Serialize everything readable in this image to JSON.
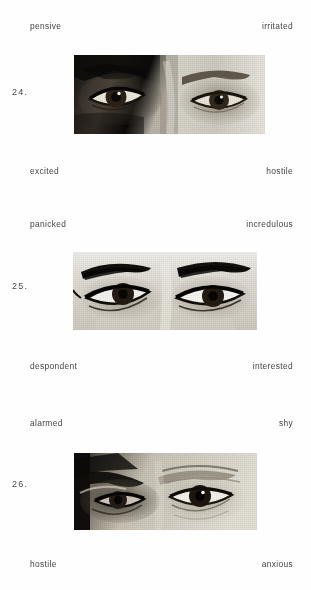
{
  "document": {
    "type": "eyes-emotion-recognition-test",
    "page_background": "#ffffff",
    "text_color": "#444444"
  },
  "items": [
    {
      "number": "24.",
      "top_left": "pensive",
      "top_right": "irritated",
      "bottom_left": "excited",
      "bottom_right": "hostile",
      "photo_alt": "cropped grayscale photograph of a pair of eyes"
    },
    {
      "number": "25.",
      "top_left": "panicked",
      "top_right": "incredulous",
      "bottom_left": "despondent",
      "bottom_right": "interested",
      "photo_alt": "cropped grayscale photograph of a pair of eyes"
    },
    {
      "number": "26.",
      "top_left": "alarmed",
      "top_right": "shy",
      "bottom_left": "hostile",
      "bottom_right": "anxious",
      "photo_alt": "cropped grayscale photograph of a pair of eyes"
    }
  ]
}
